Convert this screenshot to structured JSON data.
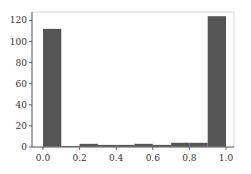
{
  "chart_data": {
    "type": "bar",
    "title": "",
    "xlabel": "",
    "ylabel": "",
    "bins": [
      {
        "x0": 0.0,
        "x1": 0.1,
        "count": 112
      },
      {
        "x0": 0.1,
        "x1": 0.2,
        "count": 1
      },
      {
        "x0": 0.2,
        "x1": 0.3,
        "count": 3
      },
      {
        "x0": 0.3,
        "x1": 0.4,
        "count": 2
      },
      {
        "x0": 0.4,
        "x1": 0.5,
        "count": 2
      },
      {
        "x0": 0.5,
        "x1": 0.6,
        "count": 3
      },
      {
        "x0": 0.6,
        "x1": 0.7,
        "count": 2
      },
      {
        "x0": 0.7,
        "x1": 0.8,
        "count": 4
      },
      {
        "x0": 0.8,
        "x1": 0.9,
        "count": 4
      },
      {
        "x0": 0.9,
        "x1": 1.0,
        "count": 124
      }
    ],
    "categories": [
      "0.0-0.1",
      "0.1-0.2",
      "0.2-0.3",
      "0.3-0.4",
      "0.4-0.5",
      "0.5-0.6",
      "0.6-0.7",
      "0.7-0.8",
      "0.8-0.9",
      "0.9-1.0"
    ],
    "values": [
      112,
      1,
      3,
      2,
      2,
      3,
      2,
      4,
      4,
      124
    ],
    "xlim": [
      -0.06,
      1.04
    ],
    "ylim": [
      0,
      128
    ],
    "xticks": [
      0.0,
      0.2,
      0.4,
      0.6,
      0.8,
      1.0
    ],
    "xtick_labels": [
      "0.0",
      "0.2",
      "0.4",
      "0.6",
      "0.8",
      "1.0"
    ],
    "yticks": [
      0,
      20,
      40,
      60,
      80,
      100,
      120
    ],
    "ytick_labels": [
      "0",
      "20",
      "40",
      "60",
      "80",
      "100",
      "120"
    ],
    "grid": false,
    "legend": null,
    "bar_color": "#555555",
    "subtype": "histogram"
  }
}
